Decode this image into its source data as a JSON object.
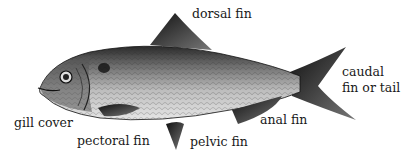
{
  "diagram": {
    "labels": {
      "dorsal": "dorsal fin",
      "caudal_line1": "caudal",
      "caudal_line2": "fin or tail",
      "anal": "anal fin",
      "pelvic": "pelvic fin",
      "pectoral": "pectoral fin",
      "gill": "gill cover"
    }
  }
}
